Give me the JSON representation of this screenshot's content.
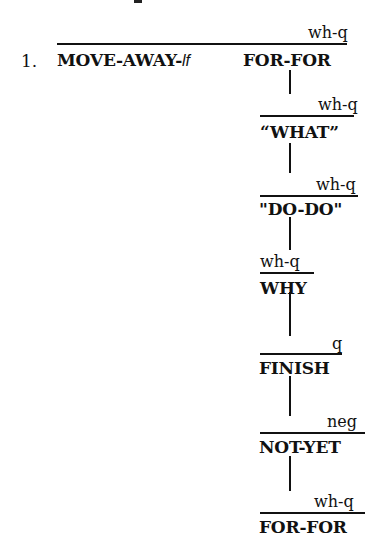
{
  "example": {
    "number": "1.",
    "top_fragment": "",
    "main_clause": {
      "gloss_prefix": "MOVE-AWAY-",
      "gloss_suffix": "lf",
      "second_sign": "FOR-FOR",
      "marker": "wh-q"
    },
    "chain": [
      {
        "marker": "wh-q",
        "gloss": "“WHAT”"
      },
      {
        "marker": "wh-q",
        "gloss": "\"DO-DO\""
      },
      {
        "marker": "wh-q",
        "gloss": "WHY"
      },
      {
        "marker": "q",
        "gloss": "FINISH"
      },
      {
        "marker": "neg",
        "gloss": "NOT-YET"
      },
      {
        "marker": "wh-q",
        "gloss": "FOR-FOR"
      }
    ]
  }
}
